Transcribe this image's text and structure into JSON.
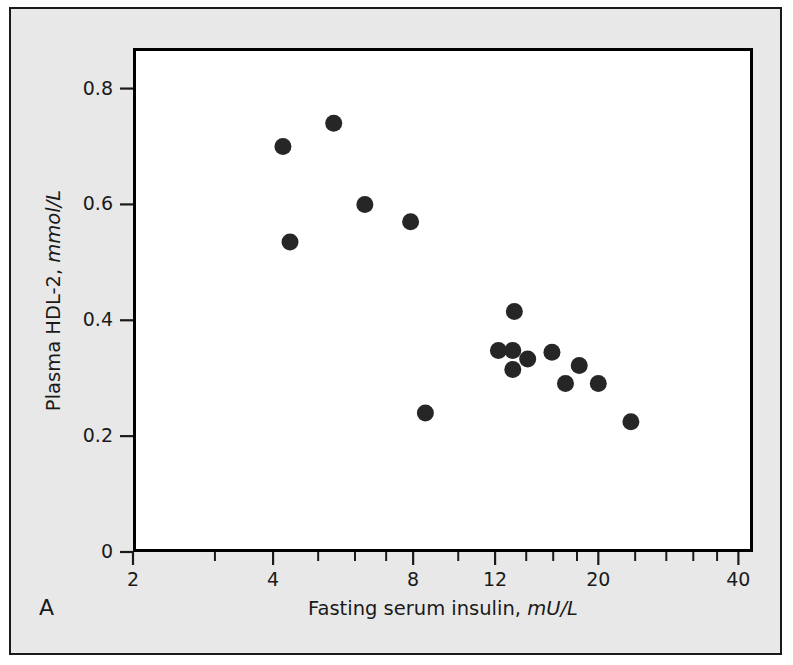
{
  "figure": {
    "panel_label": "A",
    "background_color": "#e8e8e8",
    "plot_background_color": "#ffffff",
    "frame_color": "#000000",
    "marker_color": "#262626"
  },
  "axes": {
    "y_label_main": "Plasma HDL-2, ",
    "y_label_unit": "mmol/L",
    "x_label_main": "Fasting serum insulin, ",
    "x_label_unit": "mU/L",
    "y_ticks": [
      "0",
      "0.2",
      "0.4",
      "0.6",
      "0.8"
    ],
    "x_ticks": [
      "2",
      "4",
      "8",
      "12",
      "20",
      "40"
    ]
  },
  "chart_data": {
    "type": "scatter",
    "title": "",
    "panel": "A",
    "xlabel": "Fasting serum insulin, mU/L",
    "ylabel": "Plasma HDL-2, mmol/L",
    "x_scale": "log",
    "y_scale": "linear",
    "xlim": [
      2,
      43
    ],
    "ylim": [
      0,
      0.87
    ],
    "x_tick_values": [
      2,
      4,
      8,
      12,
      20,
      40
    ],
    "x_minor_tick_values": [
      3,
      5,
      6,
      7,
      10,
      14,
      16,
      18,
      24,
      28,
      32,
      36
    ],
    "y_tick_values": [
      0,
      0.2,
      0.4,
      0.6,
      0.8
    ],
    "grid": false,
    "legend": false,
    "marker": "filled-circle",
    "points": [
      {
        "x": 4.2,
        "y": 0.7
      },
      {
        "x": 5.4,
        "y": 0.74
      },
      {
        "x": 4.35,
        "y": 0.535
      },
      {
        "x": 6.3,
        "y": 0.6
      },
      {
        "x": 7.9,
        "y": 0.57
      },
      {
        "x": 8.5,
        "y": 0.24
      },
      {
        "x": 12.2,
        "y": 0.348
      },
      {
        "x": 13.1,
        "y": 0.348
      },
      {
        "x": 13.2,
        "y": 0.415
      },
      {
        "x": 13.1,
        "y": 0.315
      },
      {
        "x": 14.1,
        "y": 0.333
      },
      {
        "x": 15.9,
        "y": 0.345
      },
      {
        "x": 17.0,
        "y": 0.291
      },
      {
        "x": 18.2,
        "y": 0.322
      },
      {
        "x": 20.0,
        "y": 0.291
      },
      {
        "x": 23.5,
        "y": 0.225
      }
    ]
  }
}
